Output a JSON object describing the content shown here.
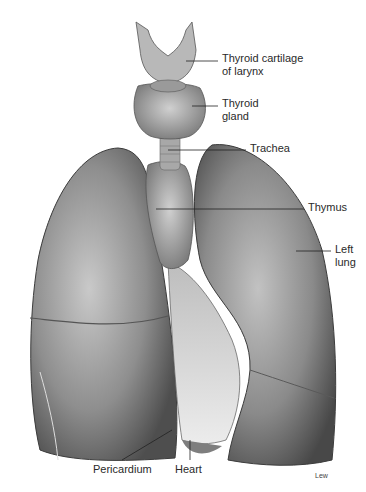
{
  "diagram": {
    "colors": {
      "background": "#ffffff",
      "tissue_dark": "#5a5a5a",
      "tissue_mid": "#8c8c8c",
      "tissue_light": "#c8c8c8",
      "label_text": "#2a2a2a",
      "leader_line": "#222222"
    },
    "labels": [
      {
        "id": "thyroid-cartilage",
        "line1": "Thyroid cartilage",
        "line2": "of larynx"
      },
      {
        "id": "thyroid-gland",
        "line1": "Thyroid",
        "line2": "gland"
      },
      {
        "id": "trachea",
        "line1": "Trachea"
      },
      {
        "id": "thymus",
        "line1": "Thymus"
      },
      {
        "id": "left-lung",
        "line1": "Left",
        "line2": "lung"
      },
      {
        "id": "pericardium",
        "line1": "Pericardium"
      },
      {
        "id": "heart",
        "line1": "Heart"
      }
    ],
    "credit": "Lew"
  }
}
